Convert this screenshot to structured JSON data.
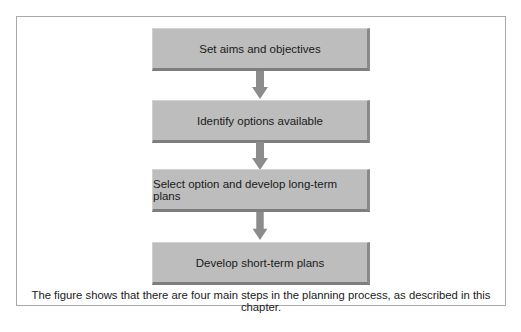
{
  "diagram": {
    "type": "flowchart",
    "direction": "top-to-bottom",
    "steps": [
      {
        "label": "Set aims and objectives"
      },
      {
        "label": "Identify options available"
      },
      {
        "label": "Select option and develop long-term plans"
      },
      {
        "label": "Develop short-term plans"
      }
    ],
    "caption": "The figure shows that there are four main steps in the planning process, as described in this chapter.",
    "colors": {
      "box_fill": "#bdbdbd",
      "box_shadow": "#7e7e7e",
      "arrow": "#8c8c8c",
      "frame_border": "#a9a9a9"
    }
  }
}
